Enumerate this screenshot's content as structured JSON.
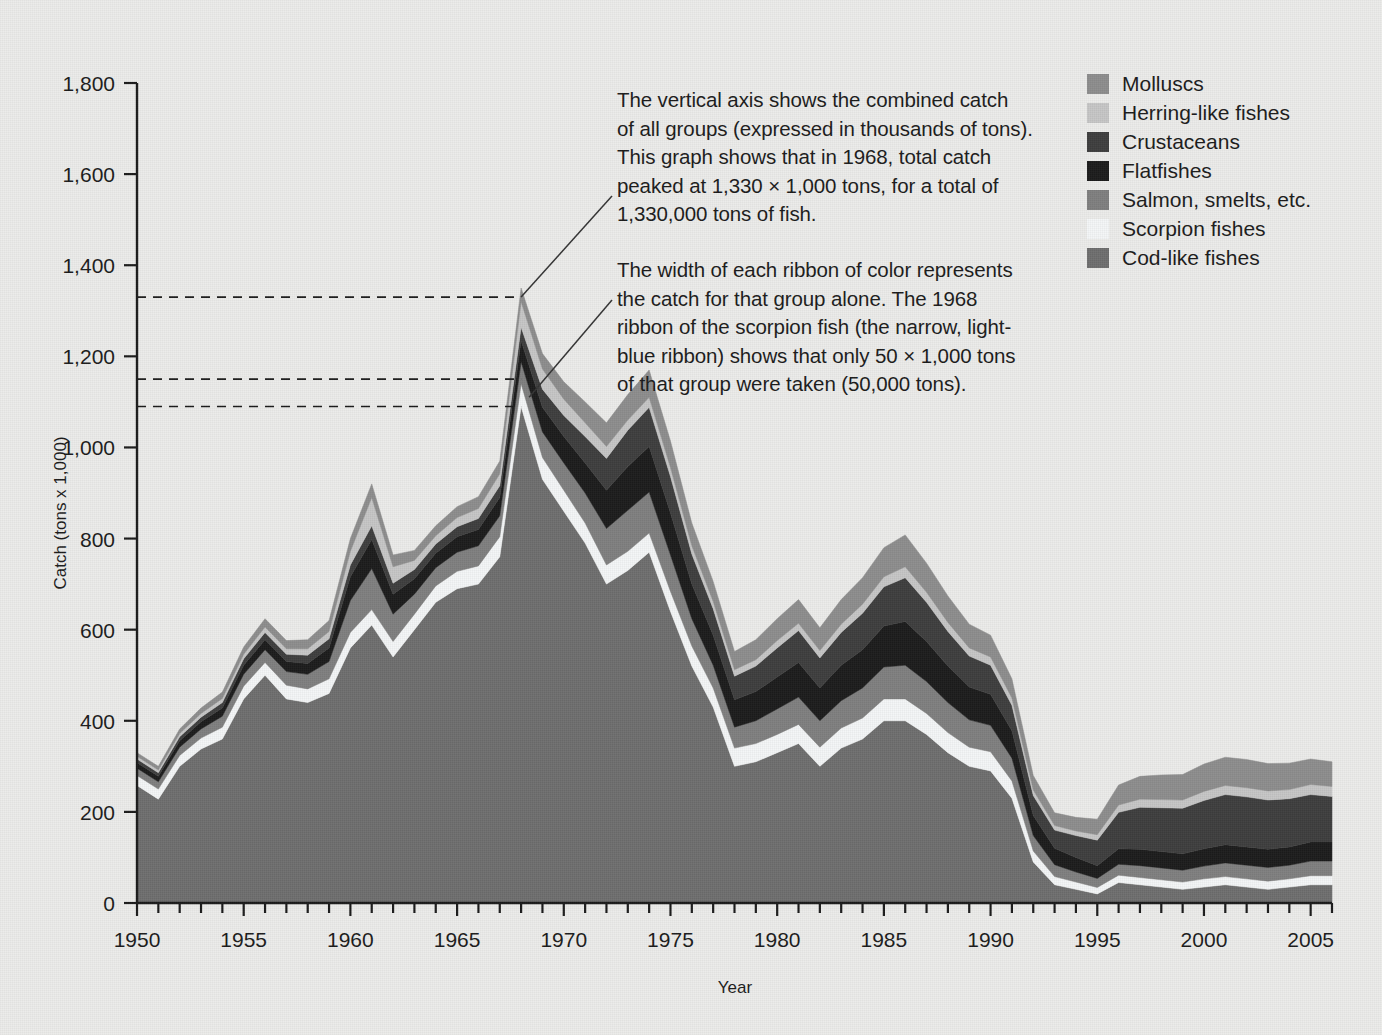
{
  "chart_data": {
    "type": "area",
    "title": "",
    "subtitle": "",
    "xlabel": "Year",
    "ylabel": "Catch (tons x 1,000)",
    "xlim": [
      1950,
      2006
    ],
    "ylim": [
      0,
      1800
    ],
    "y_ticks": [
      0,
      200,
      400,
      600,
      800,
      1000,
      1200,
      1400,
      1600,
      1800
    ],
    "y_tick_labels": [
      "0",
      "200",
      "400",
      "600",
      "800",
      "1,000",
      "1,200",
      "1,400",
      "1,600",
      "1,800"
    ],
    "x_ticks": [
      1950,
      1955,
      1960,
      1965,
      1970,
      1975,
      1980,
      1985,
      1990,
      1995,
      2000,
      2005
    ],
    "x_tick_labels": [
      "1950",
      "1955",
      "1960",
      "1965",
      "1970",
      "1975",
      "1980",
      "1985",
      "1990",
      "1995",
      "2000",
      "2005"
    ],
    "x_minor_tick_interval": 1,
    "grid": false,
    "legend_position": "top-right",
    "stack_order_bottom_to_top": [
      "Cod-like fishes",
      "Scorpion fishes",
      "Salmon, smelts, etc.",
      "Flatfishes",
      "Crustaceans",
      "Herring-like fishes",
      "Molluscs"
    ],
    "x": [
      1950,
      1951,
      1952,
      1953,
      1954,
      1955,
      1956,
      1957,
      1958,
      1959,
      1960,
      1961,
      1962,
      1963,
      1964,
      1965,
      1966,
      1967,
      1968,
      1969,
      1970,
      1971,
      1972,
      1973,
      1974,
      1975,
      1976,
      1977,
      1978,
      1979,
      1980,
      1981,
      1982,
      1983,
      1984,
      1985,
      1986,
      1987,
      1988,
      1989,
      1990,
      1991,
      1992,
      1993,
      1994,
      1995,
      1996,
      1997,
      1998,
      1999,
      2000,
      2001,
      2002,
      2003,
      2004,
      2005,
      2006
    ],
    "series": [
      {
        "name": "Cod-like fishes",
        "color": "#6e6e6e",
        "values": [
          258,
          228,
          300,
          338,
          360,
          448,
          500,
          448,
          440,
          460,
          560,
          610,
          540,
          600,
          660,
          690,
          700,
          760,
          1090,
          930,
          860,
          790,
          700,
          730,
          770,
          640,
          520,
          430,
          300,
          310,
          330,
          350,
          300,
          340,
          360,
          400,
          400,
          370,
          330,
          300,
          290,
          230,
          90,
          40,
          30,
          20,
          45,
          40,
          35,
          30,
          35,
          40,
          35,
          30,
          35,
          40,
          40
        ]
      },
      {
        "name": "Scorpion fishes",
        "color": "#f4f6f7",
        "values": [
          22,
          22,
          24,
          24,
          26,
          28,
          28,
          30,
          30,
          32,
          34,
          34,
          34,
          34,
          36,
          38,
          40,
          44,
          50,
          48,
          46,
          44,
          42,
          42,
          42,
          44,
          44,
          42,
          40,
          40,
          40,
          42,
          42,
          44,
          46,
          48,
          48,
          46,
          44,
          42,
          42,
          38,
          24,
          18,
          16,
          14,
          16,
          16,
          16,
          16,
          18,
          18,
          18,
          18,
          18,
          20,
          20
        ]
      },
      {
        "name": "Salmon, smelts, etc.",
        "color": "#7f7f7f",
        "values": [
          16,
          16,
          18,
          20,
          24,
          26,
          28,
          30,
          32,
          38,
          70,
          90,
          60,
          44,
          40,
          42,
          44,
          46,
          48,
          56,
          60,
          66,
          80,
          90,
          90,
          80,
          60,
          50,
          46,
          50,
          56,
          60,
          58,
          60,
          66,
          70,
          74,
          70,
          66,
          60,
          58,
          50,
          34,
          26,
          22,
          20,
          24,
          26,
          26,
          26,
          28,
          30,
          30,
          30,
          30,
          32,
          32
        ]
      },
      {
        "name": "Flatfishes",
        "color": "#1c1c1c",
        "values": [
          12,
          12,
          14,
          16,
          18,
          20,
          22,
          22,
          24,
          30,
          52,
          64,
          44,
          34,
          32,
          34,
          36,
          40,
          46,
          54,
          58,
          66,
          84,
          96,
          100,
          92,
          76,
          66,
          60,
          64,
          70,
          76,
          72,
          78,
          84,
          90,
          96,
          88,
          80,
          72,
          68,
          60,
          44,
          36,
          32,
          28,
          34,
          36,
          36,
          36,
          38,
          40,
          40,
          40,
          40,
          42,
          42
        ]
      },
      {
        "name": "Crustaceans",
        "color": "#3d3d3d",
        "values": [
          8,
          8,
          9,
          10,
          12,
          14,
          16,
          16,
          18,
          20,
          26,
          30,
          24,
          20,
          20,
          22,
          24,
          26,
          30,
          40,
          46,
          58,
          70,
          80,
          86,
          80,
          66,
          58,
          52,
          56,
          64,
          70,
          66,
          72,
          80,
          86,
          96,
          86,
          76,
          68,
          64,
          56,
          44,
          40,
          48,
          56,
          80,
          92,
          96,
          100,
          106,
          110,
          110,
          108,
          106,
          104,
          100
        ]
      },
      {
        "name": "Herring-like fishes",
        "color": "#c6c6c6",
        "values": [
          6,
          6,
          7,
          8,
          9,
          10,
          12,
          12,
          14,
          16,
          30,
          62,
          36,
          20,
          18,
          20,
          22,
          26,
          56,
          44,
          36,
          30,
          26,
          22,
          22,
          20,
          18,
          16,
          14,
          14,
          16,
          16,
          16,
          18,
          20,
          22,
          24,
          22,
          20,
          18,
          18,
          16,
          12,
          10,
          10,
          12,
          16,
          18,
          18,
          18,
          20,
          20,
          20,
          20,
          20,
          22,
          22
        ]
      },
      {
        "name": "Molluscs",
        "color": "#8d8d8d",
        "values": [
          8,
          8,
          10,
          12,
          14,
          16,
          18,
          18,
          20,
          24,
          28,
          30,
          26,
          22,
          22,
          24,
          26,
          28,
          30,
          34,
          38,
          46,
          52,
          56,
          60,
          58,
          50,
          44,
          40,
          44,
          48,
          52,
          50,
          54,
          58,
          64,
          70,
          64,
          58,
          52,
          48,
          42,
          32,
          28,
          30,
          34,
          44,
          50,
          54,
          56,
          60,
          62,
          62,
          60,
          58,
          56,
          54
        ]
      }
    ],
    "annotations": [
      {
        "id": "peak-total",
        "text": "The vertical axis shows the combined catch\nof all groups (expressed in thousands of tons).\nThis graph shows that in 1968, total catch\npeaked at 1,330 × 1,000 tons, for a total of\n1,330,000 tons of fish.",
        "points_to_year": 1968,
        "points_to_value": 1330
      },
      {
        "id": "scorpion-ribbon",
        "text": "The width of each ribbon of color represents\nthe catch for that group alone. The 1968\nribbon of the scorpion fish (the narrow, light-\nblue ribbon) shows that only 50 × 1,000 tons\nof that group were taken (50,000 tons).",
        "points_to_year": 1968,
        "points_to_value": 1120
      }
    ],
    "guide_lines": [
      {
        "value": 1330,
        "label": "peak total"
      },
      {
        "value": 1150,
        "label": "top of scorpion band 1968"
      },
      {
        "value": 1090,
        "label": "bottom of scorpion band 1968"
      }
    ]
  },
  "legend": {
    "items": [
      {
        "label": "Molluscs",
        "color": "#8d8d8d"
      },
      {
        "label": "Herring-like fishes",
        "color": "#c6c6c6"
      },
      {
        "label": "Crustaceans",
        "color": "#3d3d3d"
      },
      {
        "label": "Flatfishes",
        "color": "#1c1c1c"
      },
      {
        "label": "Salmon, smelts, etc.",
        "color": "#7f7f7f"
      },
      {
        "label": "Scorpion fishes",
        "color": "#f4f6f7"
      },
      {
        "label": "Cod-like fishes",
        "color": "#6e6e6e"
      }
    ]
  },
  "colors": {
    "background": "#ececea",
    "axis": "#1b1b1b",
    "text": "#1b1b1b",
    "guide_line": "#1b1b1b"
  }
}
